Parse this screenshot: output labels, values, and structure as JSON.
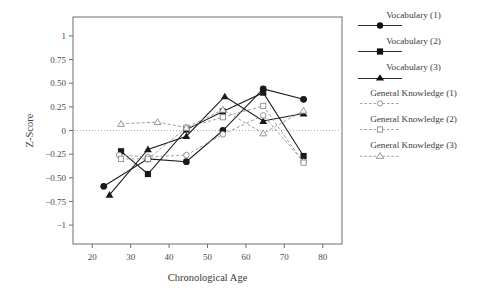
{
  "chart_data": {
    "type": "line",
    "title": "",
    "xlabel": "Chronological Age",
    "ylabel": "Z-Score",
    "xlim": [
      15,
      85
    ],
    "ylim": [
      -1.2,
      1.2
    ],
    "xticks": [
      20,
      30,
      40,
      50,
      60,
      70,
      80
    ],
    "yticks": [
      1,
      0.75,
      0.5,
      0.25,
      0,
      -0.25,
      -0.5,
      -0.75,
      -1
    ],
    "ytick_labels": [
      "1",
      "0.75",
      "0.50",
      "0.25",
      "0",
      "−0.25",
      "−0.50",
      "−0.75",
      "−1"
    ],
    "xtick_labels": [
      "20",
      "30",
      "40",
      "50",
      "60",
      "70",
      "80"
    ],
    "grid": false,
    "zero_reference_line": true,
    "legend_position": "right",
    "series": [
      {
        "name": "Vocabulary (1)",
        "marker": "filled-circle",
        "linestyle": "solid",
        "color": "#1a1a1a",
        "x": [
          23,
          34.5,
          44.5,
          54,
          64.5,
          75
        ],
        "y": [
          -0.59,
          -0.3,
          -0.33,
          0.0,
          0.44,
          0.33
        ]
      },
      {
        "name": "Vocabulary (2)",
        "marker": "filled-square",
        "linestyle": "solid",
        "color": "#1a1a1a",
        "x": [
          27.5,
          34.5,
          44.5,
          54,
          64.5,
          75
        ],
        "y": [
          -0.22,
          -0.46,
          0.01,
          0.2,
          0.4,
          -0.27
        ]
      },
      {
        "name": "Vocabulary (3)",
        "marker": "filled-triangle",
        "linestyle": "solid",
        "color": "#1a1a1a",
        "x": [
          24.5,
          34.5,
          44.5,
          54.5,
          64.5,
          75
        ],
        "y": [
          -0.68,
          -0.2,
          -0.06,
          0.36,
          0.1,
          0.18
        ]
      },
      {
        "name": "General Knowledge (1)",
        "marker": "open-circle",
        "linestyle": "dashed",
        "color": "#8c8c8c",
        "x": [
          27,
          34.5,
          44.5,
          54,
          64.5,
          75
        ],
        "y": [
          -0.26,
          -0.28,
          -0.26,
          -0.04,
          0.16,
          -0.33
        ]
      },
      {
        "name": "General Knowledge (2)",
        "marker": "open-square",
        "linestyle": "dashed",
        "color": "#8c8c8c",
        "x": [
          27.5,
          34.5,
          44.5,
          54,
          64.5,
          75
        ],
        "y": [
          -0.3,
          -0.3,
          0.03,
          0.14,
          0.26,
          -0.34
        ]
      },
      {
        "name": "General Knowledge (3)",
        "marker": "open-triangle",
        "linestyle": "dashed",
        "color": "#8c8c8c",
        "x": [
          27.5,
          37,
          44.5,
          54,
          64.5,
          75
        ],
        "y": [
          0.07,
          0.09,
          0.03,
          0.22,
          -0.03,
          0.21
        ]
      }
    ]
  },
  "legend": {
    "items": [
      {
        "label": "Vocabulary (1)",
        "marker": "filled-circle",
        "linestyle": "solid"
      },
      {
        "label": "Vocabulary (2)",
        "marker": "filled-square",
        "linestyle": "solid"
      },
      {
        "label": "Vocabulary (3)",
        "marker": "filled-triangle",
        "linestyle": "solid"
      },
      {
        "label": "General Knowledge (1)",
        "marker": "open-circle",
        "linestyle": "dashed"
      },
      {
        "label": "General Knowledge (2)",
        "marker": "open-square",
        "linestyle": "dashed"
      },
      {
        "label": "General Knowledge (3)",
        "marker": "open-triangle",
        "linestyle": "dashed"
      }
    ]
  },
  "colors": {
    "solid_series": "#1a1a1a",
    "dashed_series": "#8c8c8c",
    "frame": "#6e6e6e",
    "text": "#3a3a3a",
    "background": "#ffffff"
  }
}
